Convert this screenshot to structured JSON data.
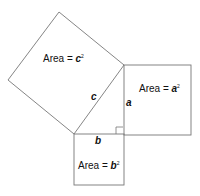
{
  "diagram": {
    "labels": {
      "area_c": {
        "prefix": "Area = ",
        "var": "c",
        "exp": "2"
      },
      "area_a": {
        "prefix": "Area = ",
        "var": "a",
        "exp": "2"
      },
      "area_b": {
        "prefix": "Area = ",
        "var": "b",
        "exp": "2"
      },
      "side_a": "a",
      "side_b": "b",
      "side_c": "c"
    },
    "colors": {
      "stroke": "#777777",
      "background": "#ffffff"
    }
  }
}
